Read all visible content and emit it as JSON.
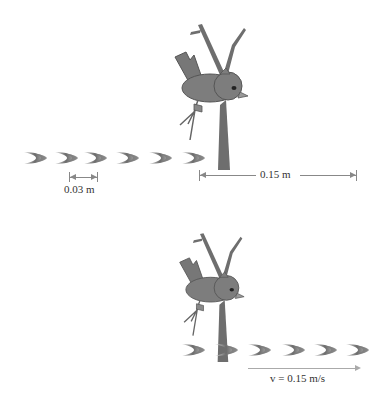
{
  "diagram": {
    "top_panel": {
      "wavefront_spacing_label": "0.03 m",
      "distance_label": "0.15 m",
      "wavefront_count": 6
    },
    "bottom_panel": {
      "velocity_label": "v = 0.15 m/s",
      "wavefront_count": 6
    },
    "colors": {
      "bird": "#7a7a7a",
      "branch": "#6e6e6e",
      "wave": "#8a8a8a",
      "dimension_line": "#888888"
    }
  }
}
